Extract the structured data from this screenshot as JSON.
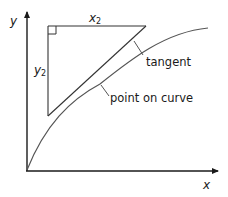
{
  "diagram": {
    "axes": {
      "x_label": "x",
      "y_label": "y"
    },
    "triangle": {
      "horizontal_label": "x",
      "horizontal_subscript": "2",
      "vertical_label": "y",
      "vertical_subscript": "2"
    },
    "annotations": {
      "tangent": "tangent",
      "point_on_curve": "point on curve"
    },
    "colors": {
      "line": "#1a1a1a",
      "curve": "#555555",
      "text": "#1a1a1a"
    }
  }
}
